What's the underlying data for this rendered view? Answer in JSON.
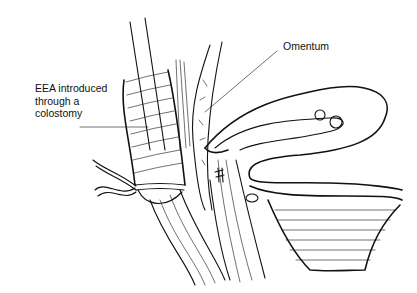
{
  "figure": {
    "type": "medical line illustration"
  },
  "labels": {
    "eea": "EEA introduced\nthrough a\ncolostomy",
    "omentum": "Omentum"
  },
  "colors": {
    "ink": "#111111",
    "background": "#ffffff"
  }
}
